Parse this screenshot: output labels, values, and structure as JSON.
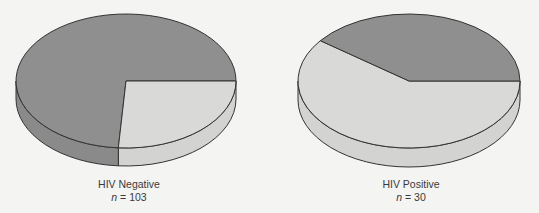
{
  "colors": {
    "dark": "#8f8f8f",
    "dark_side": "#8a8a8a",
    "light": "#d9d9d7",
    "light_side": "#d3d3d1",
    "stroke": "#333333"
  },
  "chart_data": [
    {
      "type": "pie",
      "title": "HIV Negative",
      "n_label": "n = 103",
      "n": 103,
      "slices": [
        {
          "name": "dark",
          "percent": 74
        },
        {
          "name": "light",
          "percent": 26
        }
      ],
      "geometry": {
        "cx": 126,
        "cy": 81,
        "rx": 110,
        "ry": 67,
        "depth": 18,
        "light_start_deg": 0,
        "light_end_deg": 94
      }
    },
    {
      "type": "pie",
      "title": "HIV Positive",
      "n_label": "n = 30",
      "n": 30,
      "slices": [
        {
          "name": "dark",
          "percent": 40
        },
        {
          "name": "light",
          "percent": 60
        }
      ],
      "geometry": {
        "cx": 409,
        "cy": 81,
        "rx": 111,
        "ry": 67,
        "depth": 19,
        "dark_start_deg": -143,
        "dark_end_deg": 0
      }
    }
  ],
  "labels": {
    "left_title": "HIV Negative",
    "left_n_var": "n",
    "left_n_rest": " = 103",
    "right_title": "HIV Positive",
    "right_n_var": "n",
    "right_n_rest": " = 30"
  }
}
